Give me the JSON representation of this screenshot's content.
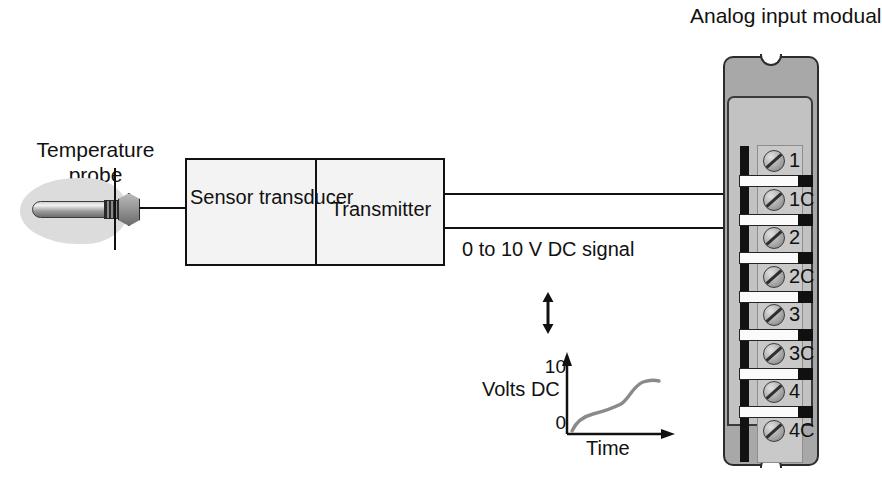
{
  "diagram": {
    "probe": {
      "label_line1": "Temperature",
      "label_line2": "probe",
      "icon": "temperature-probe-icon"
    },
    "transmitter_box": {
      "sensor_line1": "Sensor",
      "sensor_line2": "transducer",
      "transmitter": "Transmitter"
    },
    "signal": {
      "line1": "0 to 10 V",
      "line2": "DC signal",
      "arrow_icon": "double-arrow-vertical-icon"
    },
    "module": {
      "title_line1": "Analog input",
      "title_line2": "modual",
      "terminals": [
        {
          "label": "1"
        },
        {
          "label": "1C"
        },
        {
          "label": "2"
        },
        {
          "label": "2C"
        },
        {
          "label": "3"
        },
        {
          "label": "3C"
        },
        {
          "label": "4"
        },
        {
          "label": "4C"
        }
      ],
      "connected_terminals": [
        "2",
        "2C"
      ]
    },
    "colors": {
      "line": "#111111",
      "box_fill": "#f3f3f3",
      "module_shell": "#a8a8a8",
      "module_face": "#c2c2c2",
      "bus_bar": "#121212",
      "probe_blob": "#dcdcdc"
    }
  },
  "chart_data": {
    "type": "line",
    "title": "",
    "xlabel": "Time",
    "ylabel_line1": "Volts",
    "ylabel_line2": "DC",
    "yticks": [
      "0",
      "10"
    ],
    "ylim": [
      0,
      10
    ],
    "grid": false,
    "legend": "none",
    "x": [
      0,
      0.08,
      0.18,
      0.3,
      0.42,
      0.55,
      0.68,
      0.8,
      0.9,
      1.0
    ],
    "values": [
      0.2,
      1.5,
      2.3,
      2.8,
      3.1,
      3.6,
      4.8,
      5.8,
      6.2,
      6.3
    ]
  }
}
